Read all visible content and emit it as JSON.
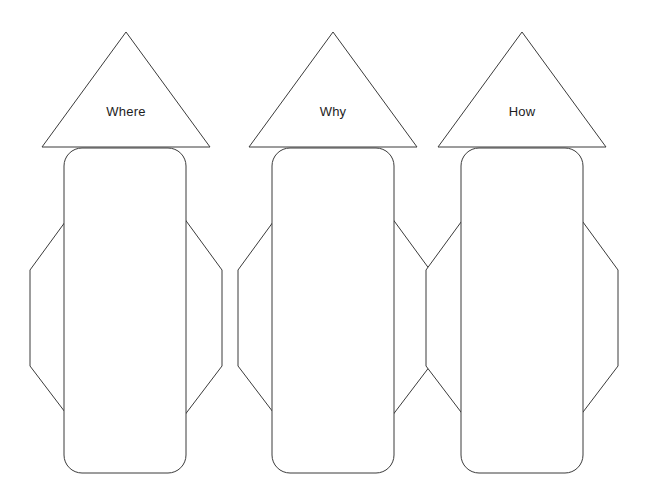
{
  "document": {
    "title": "Graphic Organizer Template",
    "background_color": "#ffffff",
    "stroke_color": "#3b3b3b",
    "fill_color": "#ffffff",
    "text_color": "#1d1d1d",
    "canvas": {
      "width": 649,
      "height": 491
    }
  },
  "groups": [
    {
      "id": "group-where",
      "label": "Where",
      "label_position": {
        "x": 126,
        "y": 113
      },
      "triangle": {
        "apex_x": 126,
        "apex_y": 32,
        "left_x": 42,
        "right_x": 210,
        "base_y": 147
      },
      "octagon": {
        "left_x": 30,
        "right_x": 222,
        "top_y": 218,
        "bottom_y": 416,
        "cut_x_left": 68,
        "cut_x_right": 184,
        "cut_y_top": 270,
        "cut_y_bottom": 366
      },
      "rounded_rect": {
        "x": 64,
        "y": 148,
        "width": 122,
        "height": 325,
        "radius": 18
      }
    },
    {
      "id": "group-why",
      "label": "Why",
      "label_position": {
        "x": 333,
        "y": 113
      },
      "triangle": {
        "apex_x": 333,
        "apex_y": 32,
        "left_x": 249,
        "right_x": 417,
        "base_y": 147
      },
      "octagon": {
        "left_x": 238,
        "right_x": 430,
        "top_y": 218,
        "bottom_y": 416,
        "cut_x_left": 276,
        "cut_x_right": 392,
        "cut_y_top": 270,
        "cut_y_bottom": 366
      },
      "rounded_rect": {
        "x": 272,
        "y": 148,
        "width": 122,
        "height": 325,
        "radius": 18
      }
    },
    {
      "id": "group-how",
      "label": "How",
      "label_position": {
        "x": 522,
        "y": 113
      },
      "triangle": {
        "apex_x": 522,
        "apex_y": 32,
        "left_x": 438,
        "right_x": 606,
        "base_y": 147
      },
      "octagon": {
        "left_x": 426,
        "right_x": 618,
        "top_y": 218,
        "bottom_y": 416,
        "cut_x_left": 464,
        "cut_x_right": 580,
        "cut_y_top": 270,
        "cut_y_bottom": 366
      },
      "rounded_rect": {
        "x": 461,
        "y": 148,
        "width": 122,
        "height": 325,
        "radius": 18
      }
    }
  ]
}
